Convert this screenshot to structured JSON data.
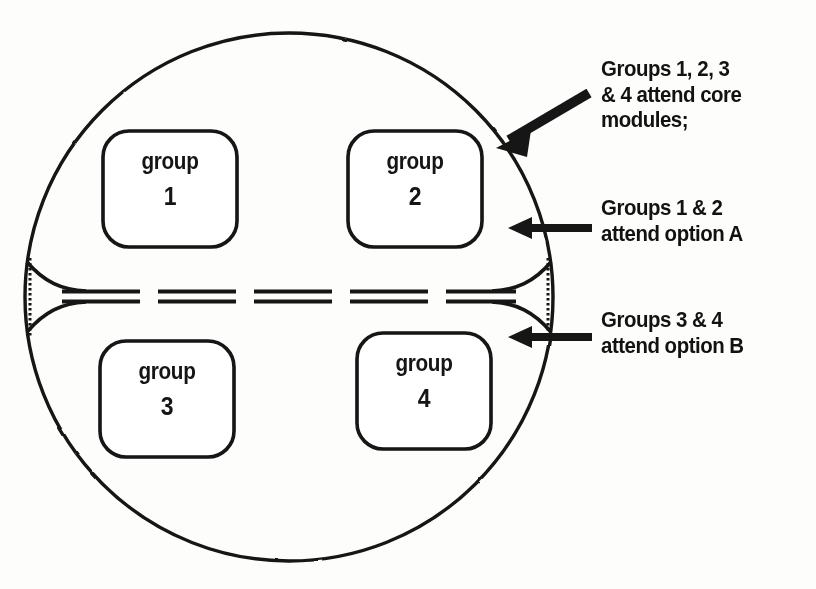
{
  "figure": {
    "ink_color": "#141414",
    "background_color": "#fdfdfc"
  },
  "cohort_circle": {
    "name": "whole cohort circle",
    "center_x": 289,
    "center_y": 297,
    "radius": 264
  },
  "divider": {
    "name": "dashed split line",
    "style": "dashed",
    "y": 296,
    "label": ""
  },
  "groups": [
    {
      "word": "group",
      "number": "1",
      "x": 103,
      "y": 131,
      "w": 134,
      "h": 116
    },
    {
      "word": "group",
      "number": "2",
      "x": 348,
      "y": 131,
      "w": 134,
      "h": 116
    },
    {
      "word": "group",
      "number": "3",
      "x": 100,
      "y": 341,
      "w": 134,
      "h": 116
    },
    {
      "word": "group",
      "number": "4",
      "x": 357,
      "y": 333,
      "w": 134,
      "h": 116
    }
  ],
  "annotations": [
    {
      "id": "core",
      "text": "Groups 1, 2, 3\n& 4 attend core\nmodules;",
      "arrow": "diagonal-down-left"
    },
    {
      "id": "option-a",
      "text": "Groups 1 & 2\nattend option A",
      "arrow": "horizontal-left"
    },
    {
      "id": "option-b",
      "text": "Groups 3 & 4\nattend option B",
      "arrow": "horizontal-left"
    }
  ]
}
